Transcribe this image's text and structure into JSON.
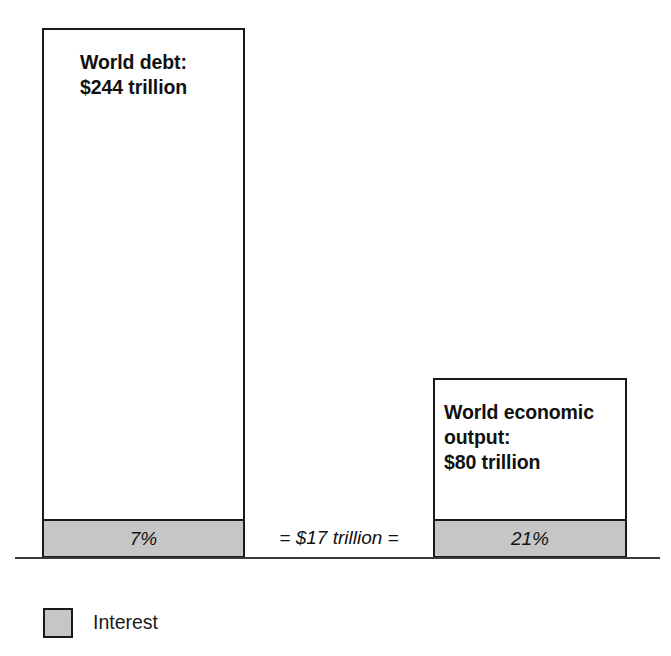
{
  "chart_data": {
    "type": "bar",
    "title": "",
    "xlabel": "",
    "ylabel": "",
    "categories": [
      "World debt",
      "World economic output"
    ],
    "series": [
      {
        "name": "Total",
        "values": [
          244,
          80
        ],
        "unit": "trillion USD",
        "value_labels": [
          "$244 trillion",
          "$80 trillion"
        ]
      },
      {
        "name": "Interest",
        "values": [
          17,
          17
        ],
        "unit": "trillion USD",
        "percent_of_total": [
          7,
          21
        ],
        "percent_labels": [
          "7%",
          "21%"
        ]
      }
    ],
    "annotations": [
      "= $17 trillion ="
    ],
    "legend": [
      "Interest"
    ],
    "legend_position": "bottom-left",
    "grid": false,
    "ylim": [
      0,
      244
    ],
    "colors": {
      "total_fill": "#ffffff",
      "interest_fill": "#c6c6c6",
      "outline": "#1a1a1a",
      "baseline": "#3a3a3a",
      "text": "#111111"
    }
  },
  "bars": {
    "debt": {
      "label": "World debt:\n$244 trillion",
      "interest_percent": "7%"
    },
    "output": {
      "label": "World economic\noutput:\n$80 trillion",
      "interest_percent": "21%"
    }
  },
  "annotation": {
    "equivalence": "= $17 trillion ="
  },
  "legend": {
    "items": [
      {
        "label": "Interest",
        "color": "#c6c6c6"
      }
    ]
  }
}
